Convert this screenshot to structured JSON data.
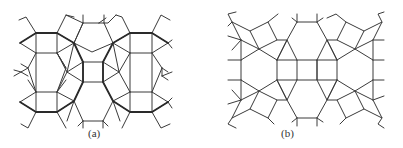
{
  "figure": {
    "type": "tessellation-diagram",
    "panels": [
      {
        "id": "a",
        "caption": "(a)",
        "description": "Tiling of regular hexagons, squares and triangles with bold outlined dodecagon-like paths"
      },
      {
        "id": "b",
        "caption": "(b)",
        "description": "Tiling of hexagons, squares and triangles with rotated squares"
      }
    ]
  },
  "colors": {
    "line": "#3a3a3a",
    "bold_line": "#2a2a2a",
    "background": "#ffffff"
  }
}
